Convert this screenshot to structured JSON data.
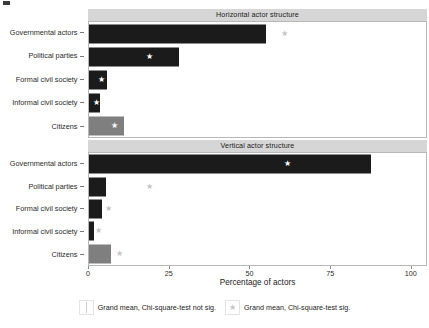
{
  "chart_data": {
    "type": "bar",
    "title": "",
    "xlabel": "Percentage of actors",
    "ylabel": "",
    "xlim": [
      0,
      105
    ],
    "xticks": [
      0,
      25,
      50,
      75,
      100
    ],
    "xticklabels": [
      "0",
      "25",
      "50",
      "75",
      "100"
    ],
    "categories": [
      "Governmental actors",
      "Political parties",
      "Formal civil society",
      "Informal civil society",
      "Citizens"
    ],
    "grid": false,
    "orientation": "horizontal",
    "legend_position": "bottom",
    "panels": [
      {
        "label": "Horizontal actor structure",
        "bars": [
          {
            "category": "Governmental actors",
            "value": 55.0,
            "color": "#1b1b1b",
            "significant": true,
            "grand_mean": 61.0,
            "marker_on_bar": false
          },
          {
            "category": "Political parties",
            "value": 28.0,
            "color": "#1b1b1b",
            "significant": true,
            "grand_mean": 19.0,
            "marker_on_bar": true
          },
          {
            "category": "Formal civil society",
            "value": 5.5,
            "color": "#1b1b1b",
            "significant": true,
            "grand_mean": 4.0,
            "marker_on_bar": true
          },
          {
            "category": "Informal civil society",
            "value": 3.5,
            "color": "#1b1b1b",
            "significant": true,
            "grand_mean": 2.4,
            "marker_on_bar": true
          },
          {
            "category": "Citizens",
            "value": 11.0,
            "color": "#7f7f7f",
            "significant": true,
            "grand_mean": 8.0,
            "marker_on_bar": true
          }
        ]
      },
      {
        "label": "Vertical actor structure",
        "bars": [
          {
            "category": "Governmental actors",
            "value": 88.0,
            "color": "#1b1b1b",
            "significant": true,
            "grand_mean": 62.0,
            "marker_on_bar": true
          },
          {
            "category": "Political parties",
            "value": 5.2,
            "color": "#1b1b1b",
            "significant": true,
            "grand_mean": 19.0,
            "marker_on_bar": false
          },
          {
            "category": "Formal civil society",
            "value": 4.0,
            "color": "#1b1b1b",
            "significant": true,
            "grand_mean": 6.2,
            "marker_on_bar": false
          },
          {
            "category": "Informal civil society",
            "value": 1.5,
            "color": "#1b1b1b",
            "significant": true,
            "grand_mean": 3.0,
            "marker_on_bar": false
          },
          {
            "category": "Citizens",
            "value": 7.0,
            "color": "#7f7f7f",
            "significant": true,
            "grand_mean": 9.5,
            "marker_on_bar": false
          }
        ]
      }
    ],
    "legend": [
      {
        "key": "box-line",
        "label": "Grand mean, Chi-square-test not sig."
      },
      {
        "key": "star",
        "label": "Grand mean, Chi-square-test sig."
      }
    ],
    "marker_glyph": "★",
    "colors": {
      "bar_dark": "#1b1b1b",
      "bar_gray": "#7f7f7f",
      "strip_background": "#d6d6d6",
      "panel_border": "#b8b8b8",
      "marker_on_bar": "#ffffff",
      "marker_off_bar": "#c4c4c4"
    }
  }
}
